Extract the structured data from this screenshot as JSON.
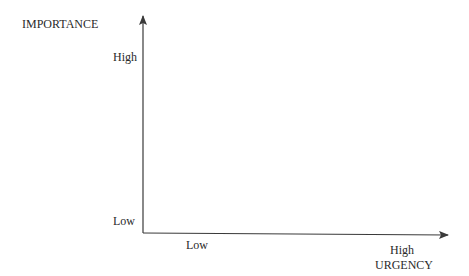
{
  "diagram": {
    "y_axis": {
      "title": "IMPORTANCE",
      "high_label": "High",
      "low_label": "Low"
    },
    "x_axis": {
      "title": "URGENCY",
      "high_label": "High",
      "low_label": "Low"
    },
    "colors": {
      "line": "#3a3a3a",
      "text": "#2a2a2a"
    }
  }
}
